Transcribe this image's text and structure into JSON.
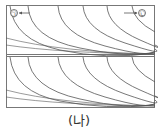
{
  "figure": {
    "caption": "(나)",
    "label_left": "㉠",
    "label_right": "㉡",
    "line_color": "#555555",
    "frame_color": "#777777",
    "panels": [
      {
        "name": "upper-panel",
        "curve_count": 6
      },
      {
        "name": "lower-panel",
        "curve_count": 6
      }
    ]
  }
}
